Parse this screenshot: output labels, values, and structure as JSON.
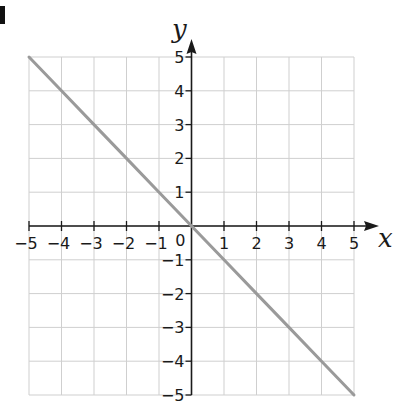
{
  "question_label_fragment": "d",
  "chart_data": {
    "type": "line",
    "title": "",
    "xlabel": "x",
    "ylabel": "y",
    "xlim": [
      -5,
      5
    ],
    "ylim": [
      -5,
      5
    ],
    "grid": true,
    "legend": null,
    "x_ticks": [
      -5,
      -4,
      -3,
      -2,
      -1,
      1,
      2,
      3,
      4,
      5
    ],
    "y_ticks": [
      5,
      4,
      3,
      2,
      1,
      -1,
      -2,
      -3,
      -4,
      -5
    ],
    "x_tick_labels": [
      "−5",
      "−4",
      "−3",
      "−2",
      "−1",
      "1",
      "2",
      "3",
      "4",
      "5"
    ],
    "y_tick_labels": [
      "5",
      "4",
      "3",
      "2",
      "1",
      "−1",
      "−2",
      "−3",
      "−4",
      "−5"
    ],
    "origin_label": "0",
    "series": [
      {
        "name": "y = -x",
        "x": [
          -5,
          -4,
          -3,
          -2,
          -1,
          0,
          1,
          2,
          3,
          4,
          5
        ],
        "y": [
          5,
          4,
          3,
          2,
          1,
          0,
          -1,
          -2,
          -3,
          -4,
          -5
        ],
        "color": "#9a9a9a"
      }
    ]
  },
  "colors": {
    "grid": "#cfcfcf",
    "axis": "#1a1a1a",
    "line": "#9a9a9a",
    "text": "#1a1a1a"
  }
}
